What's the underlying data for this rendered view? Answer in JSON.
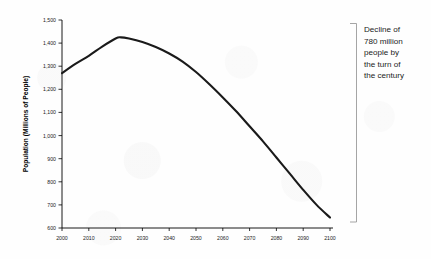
{
  "chart_data": {
    "type": "line",
    "title": "",
    "xlabel": "",
    "ylabel": "Population (Millions of People)",
    "xlim": [
      2000,
      2100
    ],
    "ylim": [
      600,
      1500
    ],
    "grid": false,
    "legend": null,
    "x_ticks": [
      "2000",
      "2010",
      "2020",
      "2030",
      "2040",
      "2050",
      "2060",
      "2070",
      "2080",
      "2090",
      "2100"
    ],
    "y_ticks": [
      "600",
      "700",
      "800",
      "900",
      "1,000",
      "1,100",
      "1,200",
      "1,300",
      "1,400",
      "1,500"
    ],
    "series": [
      {
        "name": "Population",
        "color": "#1a1a1a",
        "x": [
          2000,
          2005,
          2010,
          2015,
          2020,
          2022,
          2025,
          2030,
          2035,
          2040,
          2045,
          2050,
          2055,
          2060,
          2065,
          2070,
          2075,
          2080,
          2085,
          2090,
          2095,
          2100
        ],
        "values": [
          1270,
          1310,
          1345,
          1385,
          1420,
          1425,
          1420,
          1405,
          1383,
          1355,
          1320,
          1275,
          1222,
          1165,
          1105,
          1040,
          975,
          905,
          835,
          765,
          700,
          645
        ]
      }
    ],
    "annotations": [
      {
        "name": "decline-callout",
        "text": "Decline of 780 million people by the turn of the century",
        "lines": [
          "Decline of",
          "780 million",
          "people by",
          "the turn of",
          "the century"
        ],
        "bracket": {
          "color": "#9b9b9b"
        }
      }
    ]
  },
  "axis": {
    "y_title": "Population (Millions of People)"
  },
  "annotation": {
    "line1": "Decline of",
    "line2": "780 million",
    "line3": "people by",
    "line4": "the turn of",
    "line5": "the century"
  }
}
